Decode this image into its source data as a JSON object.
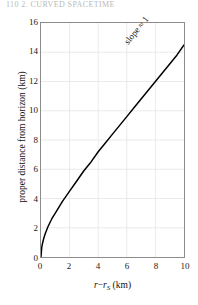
{
  "page": {
    "running_head": "110   2. CURVED SPACETIME"
  },
  "figure": {
    "slope_annotation": "slope ≈ 1"
  },
  "chart_data": {
    "type": "line",
    "title": "",
    "subtitle": "",
    "xlabel": "r − r_S (km)",
    "xlabel_parts": {
      "var1": "r",
      "minus": "−",
      "var2": "r",
      "subscript": "S",
      "units": "(km)"
    },
    "ylabel": "proper distance from horizon (km)",
    "xlim": [
      0,
      10
    ],
    "ylim": [
      0,
      16
    ],
    "xticks": [
      0,
      2,
      4,
      6,
      8,
      10
    ],
    "yticks": [
      0,
      2,
      4,
      6,
      8,
      10,
      12,
      14,
      16
    ],
    "grid": true,
    "legend": null,
    "annotations": [
      {
        "text": "slope ≈ 1",
        "x": 8.2,
        "y": 13.6,
        "rotation_deg": -51
      }
    ],
    "series": [
      {
        "name": "proper distance",
        "color": "#000000",
        "x": [
          0.0,
          0.05,
          0.1,
          0.2,
          0.3,
          0.5,
          0.75,
          1.0,
          1.5,
          2.0,
          2.5,
          3.0,
          3.5,
          4.0,
          4.5,
          5.0,
          5.5,
          6.0,
          6.5,
          7.0,
          7.5,
          8.0,
          8.5,
          9.0,
          9.5,
          10.0
        ],
        "y": [
          0.0,
          0.64,
          0.91,
          1.3,
          1.6,
          2.1,
          2.6,
          3.0,
          3.8,
          4.5,
          5.2,
          5.9,
          6.5,
          7.2,
          7.8,
          8.4,
          9.0,
          9.6,
          10.2,
          10.8,
          11.4,
          12.0,
          12.6,
          13.2,
          13.8,
          14.5
        ]
      }
    ]
  }
}
